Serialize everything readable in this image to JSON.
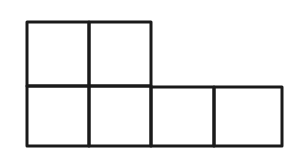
{
  "diagram": {
    "type": "grid-shape",
    "rows": [
      {
        "cells": 2
      },
      {
        "cells": 4
      }
    ],
    "stroke_color": "#1a1a1a",
    "background": "#ffffff"
  }
}
